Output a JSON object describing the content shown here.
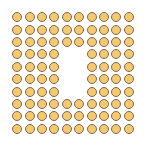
{
  "figure": {
    "rows": 10,
    "cols": 10,
    "filled_count": 92,
    "missing_count": 8,
    "colors": {
      "fill": "#f7c96e",
      "stroke": "#7a6a55",
      "background": "#ffffff"
    },
    "missing_cells": [
      [
        3,
        4
      ],
      [
        3,
        5
      ],
      [
        4,
        4
      ],
      [
        4,
        5
      ],
      [
        5,
        4
      ],
      [
        5,
        5
      ],
      [
        6,
        4
      ],
      [
        6,
        5
      ]
    ]
  }
}
